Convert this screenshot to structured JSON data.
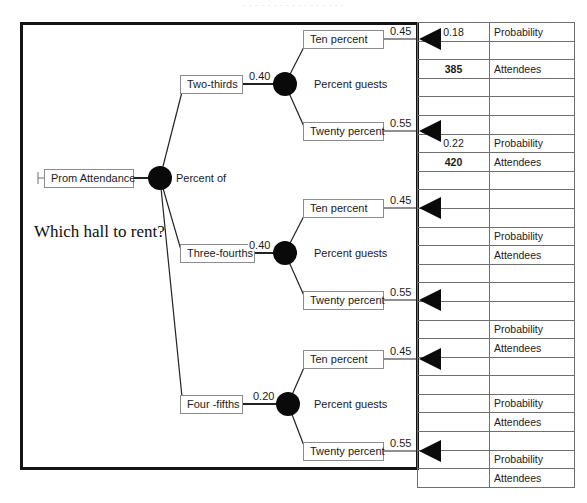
{
  "page": {
    "top_strip_text": "· · · · · · · · · · · · · · · · ·"
  },
  "diagram": {
    "question": "Which hall to rent?",
    "root": {
      "label": "Prom Attendance",
      "caption": "Percent of"
    },
    "branches": [
      {
        "name": "Two-thirds",
        "probability": "0.40",
        "node_caption": "Percent guests",
        "outcomes": [
          {
            "label": "Ten percent",
            "probability": "0.45",
            "result_probability": "0.18",
            "result_attendees": "385"
          },
          {
            "label": "Twenty percent",
            "probability": "0.55",
            "result_probability": "0.22",
            "result_attendees": "420"
          }
        ]
      },
      {
        "name": "Three-fourths",
        "probability": "0.40",
        "node_caption": "Percent guests",
        "outcomes": [
          {
            "label": "Ten percent",
            "probability": "0.45",
            "result_probability": "",
            "result_attendees": ""
          },
          {
            "label": "Twenty percent",
            "probability": "0.55",
            "result_probability": "",
            "result_attendees": ""
          }
        ]
      },
      {
        "name": "Four -fifths",
        "probability": "0.20",
        "node_caption": "Percent guests",
        "outcomes": [
          {
            "label": "Ten percent",
            "probability": "0.45",
            "result_probability": "",
            "result_attendees": ""
          },
          {
            "label": "Twenty percent",
            "probability": "0.55",
            "result_probability": "",
            "result_attendees": ""
          }
        ]
      }
    ]
  },
  "payoff_table": {
    "row_labels": {
      "probability": "Probability",
      "attendees": "Attendees"
    },
    "rows": [
      {
        "value": "0.18",
        "label": "Probability",
        "bold": false
      },
      {
        "value": "",
        "label": "",
        "bold": false
      },
      {
        "value": "385",
        "label": "Attendees",
        "bold": true
      },
      {
        "value": "",
        "label": "",
        "bold": false
      },
      {
        "value": "",
        "label": "",
        "bold": false
      },
      {
        "value": "",
        "label": "",
        "bold": false
      },
      {
        "value": "0.22",
        "label": "Probability",
        "bold": false
      },
      {
        "value": "420",
        "label": "Attendees",
        "bold": true
      },
      {
        "value": "",
        "label": "",
        "bold": false
      },
      {
        "value": "",
        "label": "",
        "bold": false
      },
      {
        "value": "",
        "label": "",
        "bold": false
      },
      {
        "value": "",
        "label": "Probability",
        "bold": false
      },
      {
        "value": "",
        "label": "Attendees",
        "bold": false
      },
      {
        "value": "",
        "label": "",
        "bold": false
      },
      {
        "value": "",
        "label": "",
        "bold": false
      },
      {
        "value": "",
        "label": "",
        "bold": false
      },
      {
        "value": "",
        "label": "Probability",
        "bold": false
      },
      {
        "value": "",
        "label": "Attendees",
        "bold": false
      },
      {
        "value": "",
        "label": "",
        "bold": false
      },
      {
        "value": "",
        "label": "",
        "bold": false
      },
      {
        "value": "",
        "label": "Probability",
        "bold": false
      },
      {
        "value": "",
        "label": "Attendees",
        "bold": false
      },
      {
        "value": "",
        "label": "",
        "bold": false
      },
      {
        "value": "",
        "label": "Probability",
        "bold": false
      },
      {
        "value": "",
        "label": "Attendees",
        "bold": false
      }
    ]
  },
  "colors": {
    "frame": "#141414",
    "node_fill": "#0a0a0a",
    "box_border": "#8d8d8d",
    "table_border": "#6f6f6f",
    "text": "#1b1b1b"
  }
}
